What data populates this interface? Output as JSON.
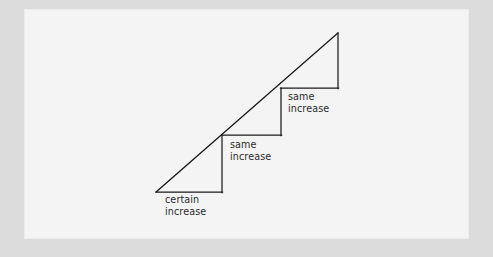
{
  "figure": {
    "kind": "line-slope-diagram",
    "background_color": "#dcdcdc",
    "panel_color": "#f4f4f4",
    "stroke_color": "#1a1a1a",
    "text_color": "#2b2b2b"
  },
  "labels": [
    {
      "line1": "certain",
      "line2": "increase"
    },
    {
      "line1": "same",
      "line2": "increase"
    },
    {
      "line1": "same",
      "line2": "increase"
    }
  ],
  "chart_data": {
    "type": "line",
    "title": "",
    "subtitle": "",
    "xlabel": "",
    "ylabel": "",
    "grid": false,
    "legend": "none",
    "annotations": [
      "certain increase",
      "same increase",
      "same increase"
    ],
    "line": {
      "start": {
        "x": 156,
        "y": 192
      },
      "end": {
        "x": 338,
        "y": 33
      }
    },
    "steps": [
      {
        "index": 1,
        "run_start": {
          "x": 156,
          "y": 192
        },
        "run_end": {
          "x": 222,
          "y": 192
        },
        "rise_start": {
          "x": 222,
          "y": 192
        },
        "rise_end": {
          "x": 222,
          "y": 135
        },
        "label": "certain increase"
      },
      {
        "index": 2,
        "run_start": {
          "x": 222,
          "y": 135
        },
        "run_end": {
          "x": 281,
          "y": 135
        },
        "rise_start": {
          "x": 281,
          "y": 135
        },
        "rise_end": {
          "x": 281,
          "y": 88
        },
        "label": "same increase"
      },
      {
        "index": 3,
        "run_start": {
          "x": 281,
          "y": 88
        },
        "run_end": {
          "x": 338,
          "y": 88
        },
        "rise_start": {
          "x": 338,
          "y": 88
        },
        "rise_end": {
          "x": 338,
          "y": 33
        },
        "label": "same increase"
      }
    ]
  }
}
